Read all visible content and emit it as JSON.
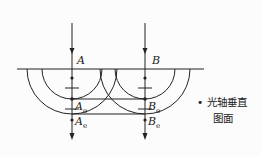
{
  "diagram": {
    "type": "optics-huygens-construction",
    "colors": {
      "line": "#222222",
      "background": "#fcfcfc"
    },
    "labels": {
      "A": "A",
      "B": "B",
      "A_o": {
        "base": "A",
        "sub": "o"
      },
      "A_e": {
        "base": "A",
        "sub": "e"
      },
      "B_o": {
        "base": "B",
        "sub": "o"
      },
      "B_e": {
        "base": "B",
        "sub": "e"
      }
    },
    "note": {
      "bullet": "•",
      "line1": "光轴垂直",
      "line2": "图面"
    }
  }
}
